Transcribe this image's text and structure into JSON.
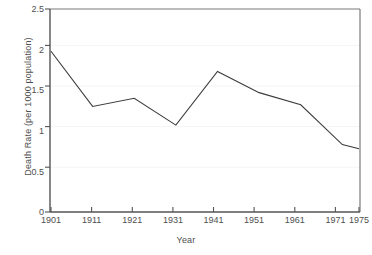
{
  "chart_data": {
    "type": "line",
    "title": "",
    "xlabel": "Year",
    "ylabel": "Death Rate (per 1000 population)",
    "categories": [
      "1901",
      "1911",
      "1921",
      "1931",
      "1941",
      "1951",
      "1961",
      "1971",
      "1975"
    ],
    "values": [
      1.98,
      1.3,
      1.4,
      1.07,
      1.73,
      1.47,
      1.32,
      0.83,
      0.78
    ],
    "series": [
      {
        "name": "Death Rate",
        "values": [
          1.98,
          1.3,
          1.4,
          1.07,
          1.73,
          1.47,
          1.32,
          0.83,
          0.78
        ]
      }
    ],
    "ylim": [
      0,
      2.5
    ],
    "yticks": [
      0,
      0.5,
      1,
      1.5,
      2,
      2.5
    ],
    "ytick_labels": [
      "0",
      "0.5",
      "1",
      "1.5",
      "2",
      "2.5"
    ],
    "xtick_labels": [
      "1901",
      "1911",
      "1921",
      "1931",
      "1941",
      "1951",
      "1961",
      "1971",
      "1975"
    ],
    "grid": "horizontal-faint",
    "legend": "none",
    "line_color": "#3c3c3c",
    "axis_color": "#666666",
    "grid_color": "#f2f2f2",
    "text_color": "#4f4f4f",
    "background": "#ffffff"
  },
  "axes": {
    "y_title": "Death Rate (per 1000 population)",
    "x_title": "Year"
  },
  "ticks": {
    "y": [
      {
        "label": "2.5",
        "value": 2.5
      },
      {
        "label": "2",
        "value": 2
      },
      {
        "label": "1.5",
        "value": 1.5
      },
      {
        "label": "1",
        "value": 1
      },
      {
        "label": "0.5",
        "value": 0.5
      },
      {
        "label": "0",
        "value": 0
      }
    ],
    "x": [
      {
        "label": "1901"
      },
      {
        "label": "1911"
      },
      {
        "label": "1921"
      },
      {
        "label": "1931"
      },
      {
        "label": "1941"
      },
      {
        "label": "1951"
      },
      {
        "label": "1961"
      },
      {
        "label": "1971"
      },
      {
        "label": "1975"
      }
    ]
  }
}
